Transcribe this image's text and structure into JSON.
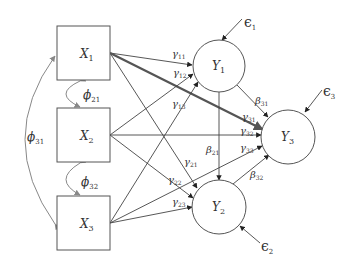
{
  "diagram": {
    "type": "structural-equation-path-diagram",
    "exogenous": [
      {
        "id": "X1",
        "base": "X",
        "sub": "1"
      },
      {
        "id": "X2",
        "base": "X",
        "sub": "2"
      },
      {
        "id": "X3",
        "base": "X",
        "sub": "3"
      }
    ],
    "endogenous": [
      {
        "id": "Y1",
        "base": "Y",
        "sub": "1"
      },
      {
        "id": "Y2",
        "base": "Y",
        "sub": "2"
      },
      {
        "id": "Y3",
        "base": "Y",
        "sub": "3"
      }
    ],
    "errors": [
      {
        "id": "e1",
        "base": "ϵ",
        "sub": "1",
        "target": "Y1"
      },
      {
        "id": "e2",
        "base": "ϵ",
        "sub": "2",
        "target": "Y2"
      },
      {
        "id": "e3",
        "base": "ϵ",
        "sub": "3",
        "target": "Y3"
      }
    ],
    "covariances": [
      {
        "id": "phi21",
        "base": "ϕ",
        "sub": "21",
        "from": "X1",
        "to": "X2"
      },
      {
        "id": "phi32",
        "base": "ϕ",
        "sub": "32",
        "from": "X2",
        "to": "X3"
      },
      {
        "id": "phi31",
        "base": "ϕ",
        "sub": "31",
        "from": "X1",
        "to": "X3"
      }
    ],
    "gamma_paths": [
      {
        "id": "g11",
        "base": "γ",
        "sub": "11",
        "from": "X1",
        "to": "Y1"
      },
      {
        "id": "g12",
        "base": "γ",
        "sub": "12",
        "from": "X2",
        "to": "Y1"
      },
      {
        "id": "g13",
        "base": "γ",
        "sub": "13",
        "from": "X3",
        "to": "Y1"
      },
      {
        "id": "g21",
        "base": "γ",
        "sub": "21",
        "from": "X1",
        "to": "Y2"
      },
      {
        "id": "g22",
        "base": "γ",
        "sub": "22",
        "from": "X2",
        "to": "Y2"
      },
      {
        "id": "g23",
        "base": "γ",
        "sub": "23",
        "from": "X3",
        "to": "Y2"
      },
      {
        "id": "g31",
        "base": "γ",
        "sub": "31",
        "from": "X1",
        "to": "Y3",
        "emphasized": true
      },
      {
        "id": "g32",
        "base": "γ",
        "sub": "32",
        "from": "X2",
        "to": "Y3"
      },
      {
        "id": "g33",
        "base": "γ",
        "sub": "33",
        "from": "X3",
        "to": "Y3"
      }
    ],
    "beta_paths": [
      {
        "id": "b21",
        "base": "β",
        "sub": "21",
        "from": "Y1",
        "to": "Y2"
      },
      {
        "id": "b31",
        "base": "β",
        "sub": "31",
        "from": "Y1",
        "to": "Y3"
      },
      {
        "id": "b32",
        "base": "β",
        "sub": "32",
        "from": "Y2",
        "to": "Y3"
      }
    ],
    "colors": {
      "stroke": "#555555",
      "covariance": "#888888",
      "text": "#333333",
      "background": "#ffffff"
    }
  }
}
